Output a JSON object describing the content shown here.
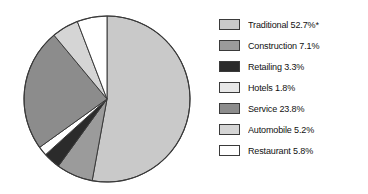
{
  "chart_data": {
    "type": "pie",
    "title": "",
    "labels": [
      "Traditional",
      "Construction",
      "Retailing",
      "Hotels",
      "Service",
      "Automobile",
      "Restaurant"
    ],
    "values": [
      52.7,
      7.1,
      3.3,
      1.8,
      23.8,
      5.2,
      5.8
    ],
    "value_suffix": "%",
    "annotations": [
      "*"
    ],
    "legend_position": "right",
    "grid": false,
    "start_angle_deg": 0,
    "direction": "clockwise",
    "slice_colors": [
      "#c9c9c9",
      "#9b9b9b",
      "#2b2b2b",
      "#ffffff",
      "#8c8c8c",
      "#d5d5d5",
      "#ffffff"
    ],
    "outline_color": "#3a3a3a",
    "legend": [
      {
        "label": "Traditional 52.7%*",
        "color": "#c9c9c9",
        "name": "traditional"
      },
      {
        "label": "Construction 7.1%",
        "color": "#9b9b9b",
        "name": "construction"
      },
      {
        "label": "Retailing 3.3%",
        "color": "#2b2b2b",
        "name": "retailing"
      },
      {
        "label": "Hotels 1.8%",
        "color": "#e8e8e8",
        "name": "hotels"
      },
      {
        "label": "Service 23.8%",
        "color": "#8c8c8c",
        "name": "service"
      },
      {
        "label": "Automobile 5.2%",
        "color": "#d5d5d5",
        "name": "automobile"
      },
      {
        "label": "Restaurant 5.8%",
        "color": "#ffffff",
        "name": "restaurant"
      }
    ]
  }
}
